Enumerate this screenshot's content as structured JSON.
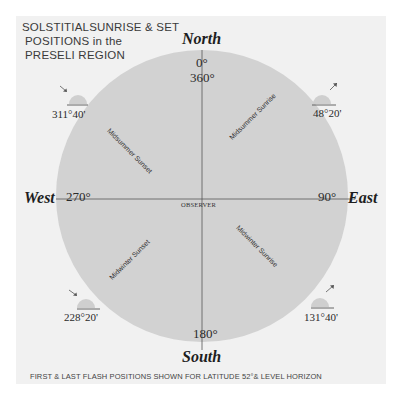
{
  "title": {
    "line1": "SOLSTITIALSUNRISE & SET",
    "line2": "POSITIONS in the",
    "line3": "PRESELI REGION"
  },
  "compass": {
    "north": "North",
    "south": "South",
    "east": "East",
    "west": "West",
    "north_deg_top": "0°",
    "north_deg_bottom": "360°",
    "south_deg": "180°",
    "east_deg": "90°",
    "west_deg": "270°",
    "center_label": "OBSERVER"
  },
  "positions": [
    {
      "name": "Midsummer Sunrise",
      "bearing": "48°20'",
      "quadrant": "NE"
    },
    {
      "name": "Midsummer Sunset",
      "bearing": "311°40'",
      "quadrant": "NW"
    },
    {
      "name": "Midwinter Sunset",
      "bearing": "228°20'",
      "quadrant": "SW"
    },
    {
      "name": "Midwinter Sunrise",
      "bearing": "131°40'",
      "quadrant": "SE"
    }
  ],
  "footer": "FIRST & LAST FLASH POSITIONS SHOWN FOR LATITUDE 52°& LEVEL HORIZON",
  "colors": {
    "background": "#f1f1f1",
    "circle": "#d2d2d2",
    "sun": "#cfcfcf",
    "lines": "#555555"
  }
}
